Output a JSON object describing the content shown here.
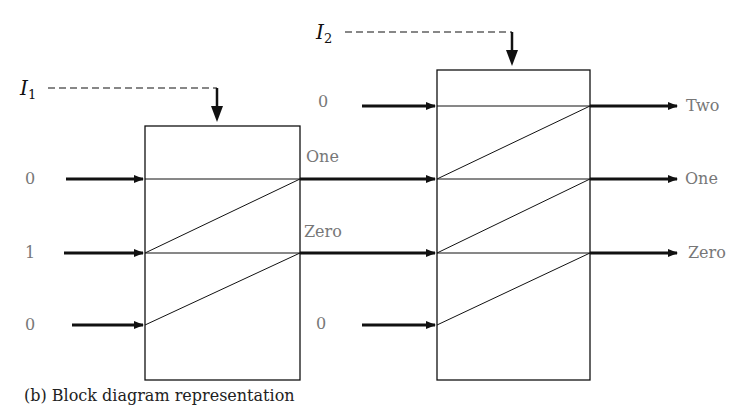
{
  "diagram": {
    "colors": {
      "line": "#111111",
      "label": "#777777",
      "background": "#ffffff"
    },
    "control_inputs": [
      {
        "name": "I",
        "sub": "1"
      },
      {
        "name": "I",
        "sub": "2"
      }
    ],
    "stage1": {
      "inputs": [
        "0",
        "1",
        "0"
      ],
      "outputs": [
        "One",
        "Zero"
      ]
    },
    "stage2": {
      "extra_inputs": [
        "0",
        "0"
      ],
      "outputs": [
        "Two",
        "One",
        "Zero"
      ]
    },
    "caption": "(b) Block diagram representation"
  }
}
